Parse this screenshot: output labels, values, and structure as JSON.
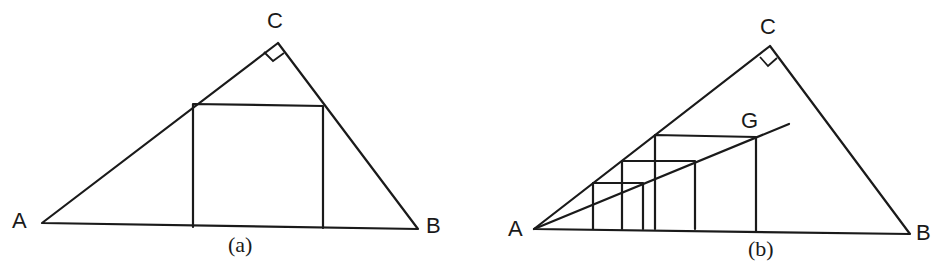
{
  "figures": [
    {
      "id": "a",
      "caption": "(a)",
      "labels": {
        "A": "A",
        "B": "B",
        "C": "C"
      },
      "description": "Right triangle ABC with right angle at C and a square inscribed with one side on AB"
    },
    {
      "id": "b",
      "caption": "(b)",
      "labels": {
        "A": "A",
        "B": "B",
        "C": "C",
        "G": "G"
      },
      "description": "Right triangle ABC with right angle at C; line from A through G; three nested squares with bases on AB, top-left corners on AC and top-right corners on line AG"
    }
  ]
}
